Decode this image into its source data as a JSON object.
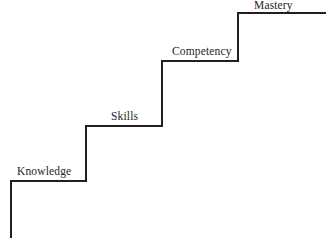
{
  "diagram": {
    "type": "staircase",
    "title": "",
    "background_color": "#ffffff",
    "line_color": "#231f20",
    "line_width": 2,
    "canvas": {
      "width": 326,
      "height": 241
    },
    "steps": [
      {
        "id": "knowledge",
        "label": "Knowledge",
        "order": 1,
        "tread_y": 181,
        "tread_x_start": 11,
        "tread_x_end": 86,
        "label_x": 17,
        "label_y": 166
      },
      {
        "id": "skills",
        "label": "Skills",
        "order": 2,
        "tread_y": 126,
        "tread_x_start": 86,
        "tread_x_end": 162,
        "label_x": 111,
        "label_y": 111
      },
      {
        "id": "competency",
        "label": "Competency",
        "order": 3,
        "tread_y": 61,
        "tread_x_start": 162,
        "tread_x_end": 238,
        "label_x": 172,
        "label_y": 46
      },
      {
        "id": "mastery",
        "label": "Mastery",
        "order": 4,
        "tread_y": 13,
        "tread_x_start": 238,
        "tread_x_end": 326,
        "label_x": 254,
        "label_y": 0
      }
    ],
    "path": "M 11 238 L 11 181 L 86 181 L 86 126 L 162 126 L 162 61 L 238 61 L 238 13 L 326 13"
  }
}
